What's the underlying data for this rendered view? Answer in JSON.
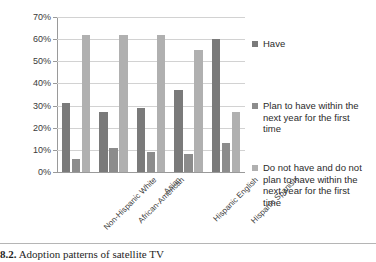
{
  "caption": {
    "number": "8.2.",
    "text": "Adoption patterns of satellite TV"
  },
  "colors": {
    "series_have": "#7a7a7a",
    "series_plan": "#8c8c8c",
    "series_no_plan": "#b0b0b0",
    "gridline": "#d2d2d2",
    "axis": "#9a9a9a"
  },
  "chart_data": {
    "type": "bar",
    "title": "",
    "xlabel": "",
    "ylabel": "",
    "ylim": [
      0,
      70
    ],
    "ytick_labels": [
      "0%",
      "10%",
      "20%",
      "30%",
      "40%",
      "50%",
      "60%",
      "70%"
    ],
    "ytick_values": [
      0,
      10,
      20,
      30,
      40,
      50,
      60,
      70
    ],
    "grid": true,
    "legend_position": "right",
    "categories": [
      "Non-Hispanic White",
      "African-American",
      "Asian",
      "Hispanic English",
      "Hispanic Spanish"
    ],
    "series": [
      {
        "name": "Have",
        "values": [
          31,
          27,
          29,
          37,
          60
        ]
      },
      {
        "name": "Plan to have within the next year for the first time",
        "values": [
          6,
          11,
          9,
          8,
          13
        ]
      },
      {
        "name": "Do not have and do not plan to have within the next year for the first time",
        "values": [
          62,
          62,
          62,
          55,
          27
        ]
      }
    ]
  }
}
